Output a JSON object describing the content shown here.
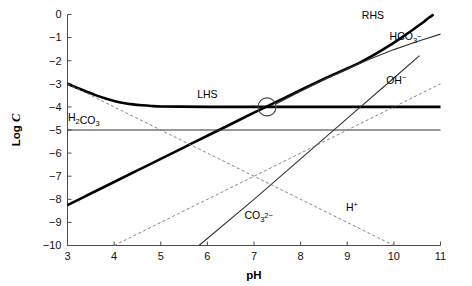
{
  "chart_data": {
    "type": "line",
    "title": "",
    "xlabel": "pH",
    "ylabel": "Log C",
    "xlim": [
      3,
      11
    ],
    "ylim": [
      -10,
      0
    ],
    "grid": false,
    "legend_position": "inline-labels",
    "xticks": [
      "3",
      "4",
      "5",
      "6",
      "7",
      "8",
      "9",
      "10",
      "11"
    ],
    "yticks": [
      "0",
      "−1",
      "−2",
      "−3",
      "−4",
      "−5",
      "−6",
      "−7",
      "−8",
      "−9",
      "−10"
    ],
    "series": [
      {
        "name": "LHS",
        "label": "LHS",
        "style": "thick-solid",
        "label_x": 6.0,
        "label_y": -3.62,
        "points": [
          [
            3.0,
            -3.0
          ],
          [
            3.2,
            -3.17
          ],
          [
            3.4,
            -3.33
          ],
          [
            3.6,
            -3.49
          ],
          [
            3.8,
            -3.63
          ],
          [
            4.0,
            -3.74
          ],
          [
            4.2,
            -3.83
          ],
          [
            4.4,
            -3.89
          ],
          [
            4.6,
            -3.93
          ],
          [
            4.8,
            -3.96
          ],
          [
            5.0,
            -3.98
          ],
          [
            5.4,
            -3.99
          ],
          [
            6.0,
            -4.0
          ],
          [
            7.0,
            -4.0
          ],
          [
            8.0,
            -4.0
          ],
          [
            9.0,
            -4.0
          ],
          [
            10.0,
            -4.0
          ],
          [
            11.0,
            -4.0
          ]
        ]
      },
      {
        "name": "RHS",
        "label": "RHS",
        "style": "thick-solid",
        "label_x": 9.55,
        "label_y": -0.18,
        "points": [
          [
            3.0,
            -8.25
          ],
          [
            3.5,
            -7.75
          ],
          [
            4.0,
            -7.25
          ],
          [
            4.5,
            -6.75
          ],
          [
            5.0,
            -6.25
          ],
          [
            5.5,
            -5.75
          ],
          [
            6.0,
            -5.25
          ],
          [
            6.5,
            -4.75
          ],
          [
            7.0,
            -4.25
          ],
          [
            7.5,
            -3.76
          ],
          [
            8.0,
            -3.27
          ],
          [
            8.5,
            -2.79
          ],
          [
            9.0,
            -2.34
          ],
          [
            9.3,
            -2.05
          ],
          [
            9.6,
            -1.72
          ],
          [
            9.9,
            -1.35
          ],
          [
            10.2,
            -0.95
          ],
          [
            10.4,
            -0.67
          ],
          [
            10.6,
            -0.38
          ],
          [
            10.75,
            -0.14
          ],
          [
            10.85,
            0.0
          ]
        ]
      },
      {
        "name": "HCO3-",
        "label": "HCO₃⁻",
        "style": "thin-solid",
        "label_x": 10.25,
        "label_y": -1.1,
        "points": [
          [
            7.45,
            -3.9
          ],
          [
            8.0,
            -3.32
          ],
          [
            8.5,
            -2.82
          ],
          [
            9.0,
            -2.36
          ],
          [
            9.5,
            -1.92
          ],
          [
            10.0,
            -1.52
          ],
          [
            10.5,
            -1.17
          ],
          [
            11.0,
            -0.85
          ]
        ]
      },
      {
        "name": "H2CO3",
        "label": "H₂CO₃",
        "style": "thin-solid",
        "label_x": 3.35,
        "label_y": -4.62,
        "points": [
          [
            3.0,
            -5.0
          ],
          [
            11.0,
            -5.0
          ]
        ]
      },
      {
        "name": "CO3 2-",
        "label": "CO₃²⁻",
        "style": "thin-solid",
        "label_x": 7.1,
        "label_y": -8.85,
        "points": [
          [
            5.82,
            -10.0
          ],
          [
            7.0,
            -8.0
          ],
          [
            8.0,
            -6.25
          ],
          [
            9.0,
            -4.5
          ],
          [
            10.0,
            -2.75
          ],
          [
            10.55,
            -1.78
          ]
        ]
      },
      {
        "name": "H+",
        "label": "H⁺",
        "style": "dashed",
        "label_x": 9.1,
        "label_y": -8.5,
        "points": [
          [
            3.0,
            -3.0
          ],
          [
            10.0,
            -10.0
          ]
        ]
      },
      {
        "name": "OH-",
        "label": "OH⁻",
        "style": "dashed",
        "label_x": 10.05,
        "label_y": -3.0,
        "points": [
          [
            4.0,
            -10.0
          ],
          [
            11.0,
            -3.0
          ]
        ]
      }
    ],
    "annotations": [
      {
        "name": "intersection-marker",
        "type": "circle",
        "x": 7.28,
        "y": -4.0,
        "radius_px": 9
      }
    ]
  }
}
